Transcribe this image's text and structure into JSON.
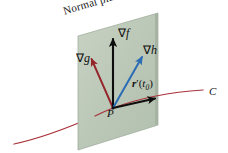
{
  "figure": {
    "width": 228,
    "height": 153,
    "background": "#ffffff"
  },
  "labels": {
    "normal_plane": "Normal plane",
    "grad_f": "∇f",
    "grad_h": "∇h",
    "grad_g": "∇g",
    "r_prime": "r′(t₀)",
    "point_p": "P",
    "curve_c": "C"
  },
  "colors": {
    "plane_fill": "#b7c4b4",
    "plane_fill_light": "#c6d1c2",
    "plane_edge": "#8e9c8c",
    "vector_black": "#0d0d0d",
    "vector_blue": "#2b6cb5",
    "vector_red": "#94252b",
    "curve_red": "#a8333a",
    "text": "#101010"
  },
  "geometry": {
    "point_p": {
      "x": 113,
      "y": 108
    },
    "plane_corners": [
      {
        "x": 78,
        "y": 36
      },
      {
        "x": 158,
        "y": 13
      },
      {
        "x": 158,
        "y": 125
      },
      {
        "x": 78,
        "y": 150
      }
    ],
    "vectors": [
      {
        "name": "grad-f",
        "color": "#0d0d0d",
        "from": {
          "x": 113,
          "y": 108
        },
        "to": {
          "x": 113,
          "y": 38
        }
      },
      {
        "name": "grad-h",
        "color": "#2b6cb5",
        "from": {
          "x": 113,
          "y": 108
        },
        "to": {
          "x": 143,
          "y": 56
        }
      },
      {
        "name": "grad-g",
        "color": "#94252b",
        "from": {
          "x": 113,
          "y": 108
        },
        "to": {
          "x": 91,
          "y": 58
        }
      },
      {
        "name": "r-prime",
        "color": "#0d0d0d",
        "from": {
          "x": 113,
          "y": 108
        },
        "to": {
          "x": 156,
          "y": 98
        }
      }
    ],
    "curve": {
      "name": "curve-c",
      "color": "#a8333a",
      "path": "M 14 144 C 45 137 82 120 113 108 C 140 98 172 92 203 90"
    }
  }
}
